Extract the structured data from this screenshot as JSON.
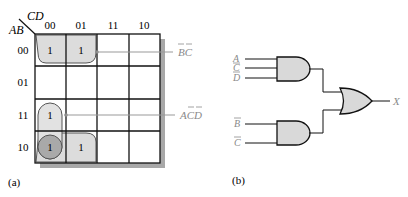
{
  "kmap": {
    "row_var": "AB",
    "col_var": "CD",
    "col_headers": [
      "00",
      "01",
      "11",
      "10"
    ],
    "row_headers": [
      "00",
      "01",
      "11",
      "10"
    ],
    "cells": [
      [
        "1",
        "1",
        "",
        ""
      ],
      [
        "",
        "",
        "",
        ""
      ],
      [
        "1",
        "",
        "",
        ""
      ],
      [
        "1",
        "1",
        "",
        ""
      ]
    ],
    "groups": [
      {
        "term": "B̄C̄",
        "display": "BC",
        "cells": "row 00 cols 00-01 and row 10 cols 00-01 (wraparound)"
      },
      {
        "term": "AC̄D̄",
        "display": "ACD",
        "cells": "col 00 rows 11-10"
      }
    ],
    "term_label_1": "BC",
    "term_label_2": "ACD",
    "caption": "(a)"
  },
  "circuit": {
    "gate1_inputs": [
      "A",
      "C",
      "D"
    ],
    "gate2_inputs": [
      "B",
      "C"
    ],
    "output_label": "X",
    "caption": "(b)"
  },
  "colors": {
    "grid": "#111111",
    "group_fill": "#dcdcdc",
    "overlap_fill": "#a9a9a9",
    "shadow": "#a0a0a0",
    "gate_fill": "#d9d9d9",
    "label_gray": "#8a8a8a"
  }
}
